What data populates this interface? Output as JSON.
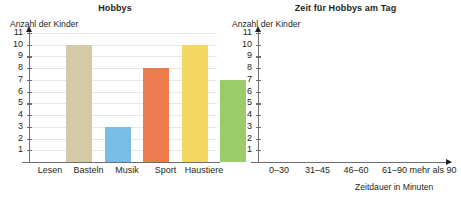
{
  "charts": [
    {
      "id": "hobbys",
      "title": "Hobbys",
      "ylabel": "Anzahl der Kinder",
      "xlabel": "",
      "ticks": [
        "11",
        "10",
        "9",
        "8",
        "7",
        "6",
        "5",
        "4",
        "3",
        "2",
        "1"
      ],
      "categories": [
        "Lesen",
        "Basteln",
        "Musik",
        "Sport",
        "Haustiere"
      ],
      "values": [
        10,
        3,
        8,
        10,
        7
      ],
      "colors": [
        "#d5c9a8",
        "#77bde6",
        "#ec7b4e",
        "#f4d861",
        "#9ccb6a"
      ]
    },
    {
      "id": "zeit",
      "title": "Zeit für Hobbys am Tag",
      "ylabel": "Anzahl der Kinder",
      "xlabel": "Zeitdauer in Minuten",
      "ticks": [
        "11",
        "10",
        "9",
        "8",
        "7",
        "6",
        "5",
        "4",
        "3",
        "2",
        "1"
      ],
      "categories": [
        "0–30",
        "31–45",
        "46–60",
        "61–90",
        "mehr als 90"
      ],
      "values": [
        6,
        7,
        11,
        3,
        1
      ],
      "colors": [
        "#f7dd74",
        "#f6cf69",
        "#ec7b4e",
        "#d5c9a8",
        "#77bde6"
      ]
    }
  ],
  "chart_data": [
    {
      "type": "bar",
      "title": "Hobbys",
      "xlabel": "",
      "ylabel": "Anzahl der Kinder",
      "categories": [
        "Lesen",
        "Basteln",
        "Musik",
        "Sport",
        "Haustiere"
      ],
      "values": [
        10,
        3,
        8,
        10,
        7
      ],
      "ylim": [
        0,
        11
      ],
      "ytick_labels": [
        "1",
        "2",
        "3",
        "4",
        "5",
        "6",
        "7",
        "8",
        "9",
        "10",
        "11"
      ],
      "grid": true,
      "legend": "none",
      "bar_colors": [
        "#d5c9a8",
        "#77bde6",
        "#ec7b4e",
        "#f4d861",
        "#9ccb6a"
      ]
    },
    {
      "type": "bar",
      "title": "Zeit für Hobbys am Tag",
      "xlabel": "Zeitdauer in Minuten",
      "ylabel": "Anzahl der Kinder",
      "categories": [
        "0–30",
        "31–45",
        "46–60",
        "61–90",
        "mehr als 90"
      ],
      "values": [
        6,
        7,
        11,
        3,
        1
      ],
      "ylim": [
        0,
        11
      ],
      "ytick_labels": [
        "1",
        "2",
        "3",
        "4",
        "5",
        "6",
        "7",
        "8",
        "9",
        "10",
        "11"
      ],
      "grid": true,
      "legend": "none",
      "bar_colors": [
        "#f7dd74",
        "#f6cf69",
        "#ec7b4e",
        "#d5c9a8",
        "#77bde6"
      ]
    }
  ]
}
